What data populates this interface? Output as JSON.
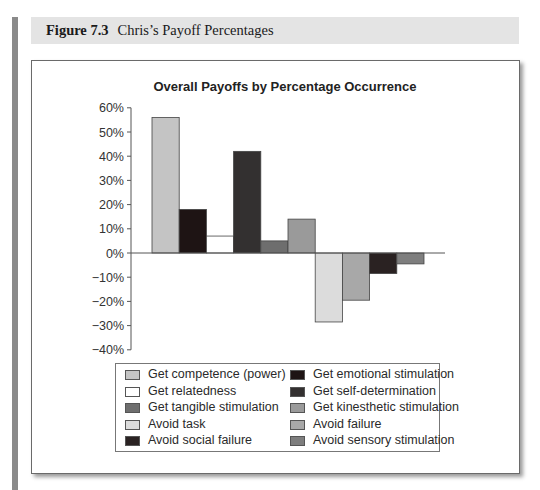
{
  "figure": {
    "number": "Figure 7.3",
    "caption": "Chris’s Payoff Percentages"
  },
  "chart_data": {
    "type": "bar",
    "title": "Overall Payoffs by Percentage Occurrence",
    "xlabel": "",
    "ylabel": "",
    "ylim": [
      -40,
      60
    ],
    "yticks": [
      "60%",
      "50%",
      "40%",
      "30%",
      "20%",
      "10%",
      "0%",
      "−10%",
      "−20%",
      "−30%",
      "−40%"
    ],
    "grid": false,
    "legend_position": "bottom",
    "categories": [
      "Get competence (power)",
      "Get emotional stimulation",
      "Get relatedness",
      "Get self-determination",
      "Get tangible stimulation",
      "Get kinesthetic stimulation",
      "Avoid task",
      "Avoid failure",
      "Avoid social failure",
      "Avoid sensory stimulation"
    ],
    "values": [
      56,
      18,
      7,
      42,
      5,
      14,
      -28.5,
      -19.5,
      -8.5,
      -4.5
    ],
    "colors": [
      "#c4c4c4",
      "#1e1414",
      "#ffffff",
      "#333030",
      "#6e6e6e",
      "#9a9a9a",
      "#dcdcdc",
      "#a8a8a8",
      "#2a2222",
      "#7e7e7e"
    ]
  },
  "legend": {
    "items": [
      {
        "label": "Get competence (power)",
        "color": "#c4c4c4"
      },
      {
        "label": "Get emotional stimulation",
        "color": "#1e1414"
      },
      {
        "label": "Get relatedness",
        "color": "#ffffff"
      },
      {
        "label": "Get self-determination",
        "color": "#333030"
      },
      {
        "label": "Get tangible stimulation",
        "color": "#6e6e6e"
      },
      {
        "label": "Get kinesthetic stimulation",
        "color": "#9a9a9a"
      },
      {
        "label": "Avoid task",
        "color": "#dcdcdc"
      },
      {
        "label": "Avoid failure",
        "color": "#a8a8a8"
      },
      {
        "label": "Avoid social failure",
        "color": "#2a2222"
      },
      {
        "label": "Avoid sensory stimulation",
        "color": "#7e7e7e"
      }
    ]
  }
}
